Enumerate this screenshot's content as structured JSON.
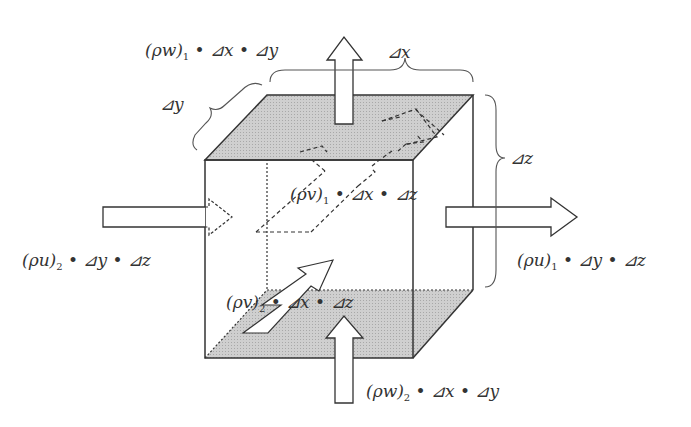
{
  "diagram": {
    "type": "control-volume-mass-flux",
    "colors": {
      "stroke": "#333333",
      "shade": "#c8c8c8",
      "background": "#ffffff",
      "arrow_fill": "#ffffff"
    },
    "dimensions": {
      "dx": "⊿x",
      "dy": "⊿y",
      "dz": "⊿z"
    },
    "fluxes": {
      "w_out": {
        "prefix": "(ρw)",
        "sub": "1",
        "rest": " • ⊿x • ⊿y"
      },
      "w_in": {
        "prefix": "(ρw)",
        "sub": "2",
        "rest": " • ⊿x • ⊿y"
      },
      "u_in": {
        "prefix": "(ρu)",
        "sub": "2",
        "rest": " • ⊿y • ⊿z"
      },
      "u_out": {
        "prefix": "(ρu)",
        "sub": "1",
        "rest": " • ⊿y • ⊿z"
      },
      "v_out": {
        "prefix": "(ρv)",
        "sub": "1",
        "rest": " • ⊿x • ⊿z"
      },
      "v_in": {
        "prefix": "(ρv)",
        "sub": "2",
        "rest": " • ⊿x • ⊿z"
      }
    }
  }
}
